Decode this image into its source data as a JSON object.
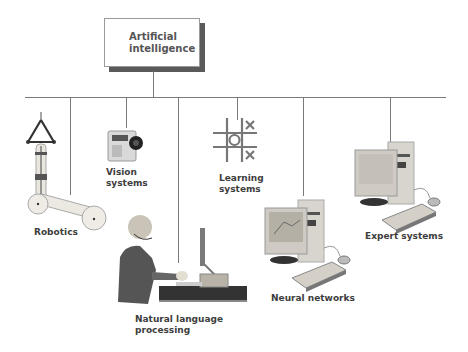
{
  "diagram": {
    "root": {
      "label_line1": "Artificial",
      "label_line2": "intelligence"
    },
    "branches": [
      {
        "id": "robotics",
        "label": "Robotics",
        "icon": "robotic-arm-icon"
      },
      {
        "id": "vision",
        "label": "Vision\nsystems",
        "icon": "camera-icon"
      },
      {
        "id": "nlp",
        "label": "Natural language\nprocessing",
        "icon": "person-at-computer-icon"
      },
      {
        "id": "learning",
        "label": "Learning\nsystems",
        "icon": "tic-tac-toe-icon"
      },
      {
        "id": "neural",
        "label": "Neural networks",
        "icon": "desktop-computer-icon"
      },
      {
        "id": "expert",
        "label": "Expert systems",
        "icon": "desktop-computer-icon"
      }
    ]
  },
  "colors": {
    "line": "#7a7a7a",
    "text": "#3d3d3d",
    "shadow": "#5a5a5a"
  }
}
